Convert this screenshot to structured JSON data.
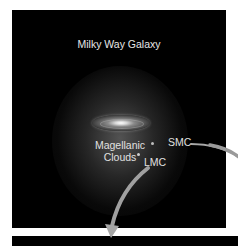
{
  "diagram": {
    "title": "Milky Way Galaxy",
    "labels": {
      "magellanic_line1": "Magellanic",
      "magellanic_line2": "Clouds",
      "smc": "SMC",
      "lmc": "LMC"
    },
    "colors": {
      "background": "#000000",
      "page": "#ffffff",
      "text": "#e0e0e0",
      "arrow": "#9a9a9a"
    }
  }
}
